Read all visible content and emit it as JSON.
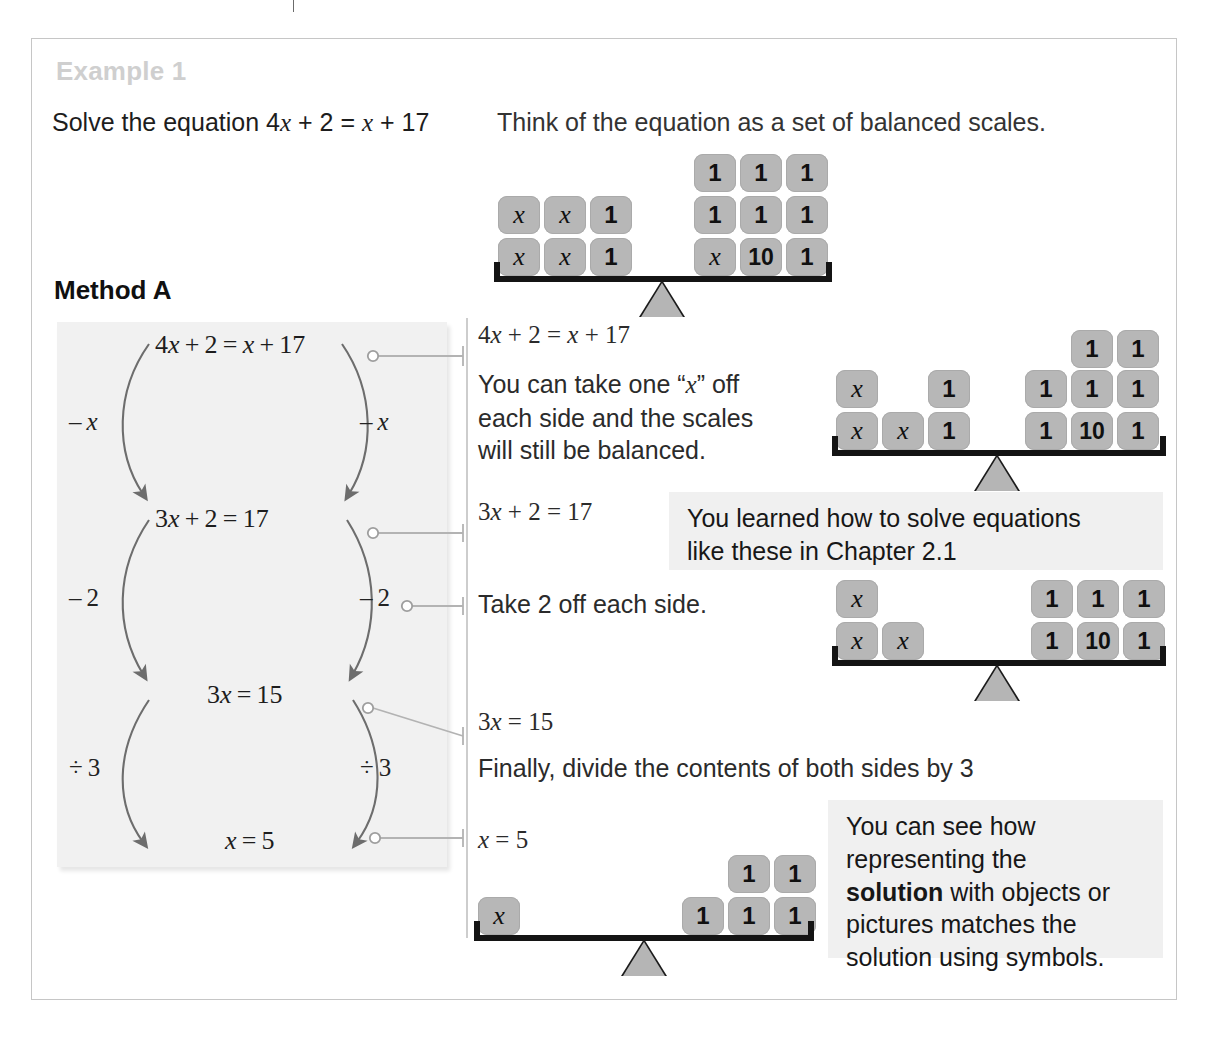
{
  "page": {
    "example_title": "Example 1",
    "solve_prompt": "Solve the equation 4x + 2 = x + 17",
    "think_prompt": "Think of the equation as a set of balanced scales.",
    "method_title": "Method A"
  },
  "method_flow": {
    "equations": [
      "4x + 2 = x + 17",
      "3x + 2 = 17",
      "3x = 15",
      "x = 5"
    ],
    "operations_left": [
      "– x",
      "– 2",
      "÷ 3"
    ],
    "operations_right": [
      "– x",
      "– 2",
      "÷ 3"
    ]
  },
  "notes": [
    {
      "equation": "4x + 2 = x + 17",
      "text": "You can take one “x” off each side and the scales will still be balanced."
    },
    {
      "equation": "3x + 2 = 17",
      "text": "Take 2 off each side."
    },
    {
      "equation": "3x = 15",
      "text": "Finally, divide the contents of both sides by 3"
    },
    {
      "equation": "x = 5",
      "text": ""
    }
  ],
  "callouts": [
    {
      "line1": "You learned how to solve equations",
      "line2": "like these in Chapter 2.1"
    },
    {
      "line1": "You can see how",
      "line2": "representing the",
      "line3_bold": "solution",
      "line3_rest": " with objects or",
      "line4": "pictures matches the",
      "line5": "solution using symbols."
    }
  ],
  "scales": [
    {
      "name": "scale-initial",
      "equation": "4x + 2 = x + 17",
      "left_rows": [
        [
          "x",
          "x",
          "1"
        ],
        [
          "x",
          "x",
          "1"
        ]
      ],
      "right_rows": [
        [
          "1",
          "1",
          "1"
        ],
        [
          "1",
          "1",
          "1"
        ],
        [
          "x",
          "10",
          "1"
        ]
      ]
    },
    {
      "name": "scale-minus-x",
      "equation": "3x + 2 = 17",
      "left_rows": [
        [
          "x",
          "",
          "1"
        ],
        [
          "x",
          "x",
          "1"
        ]
      ],
      "right_rows": [
        [
          "",
          "1",
          "1"
        ],
        [
          "1",
          "1",
          "1"
        ],
        [
          "1",
          "10",
          "1"
        ]
      ]
    },
    {
      "name": "scale-minus-2",
      "equation": "3x = 15",
      "left_rows": [
        [
          "x",
          ""
        ],
        [
          "x",
          "x"
        ]
      ],
      "right_rows": [
        [
          "1",
          "1",
          "1"
        ],
        [
          "1",
          "10",
          "1"
        ]
      ]
    },
    {
      "name": "scale-divide-3",
      "equation": "x = 5",
      "left_rows": [
        [
          "x"
        ]
      ],
      "right_rows": [
        [
          "",
          "1",
          "1"
        ],
        [
          "1",
          "1",
          "1"
        ]
      ]
    }
  ],
  "colors": {
    "tile_fill": "#b7b7b7",
    "panel_fill": "#f1f1f1",
    "callout_fill": "#f0f0f0",
    "title_gray": "#cfcfcf",
    "beam_black": "#141414",
    "rule_gray": "#cdcdcd"
  }
}
